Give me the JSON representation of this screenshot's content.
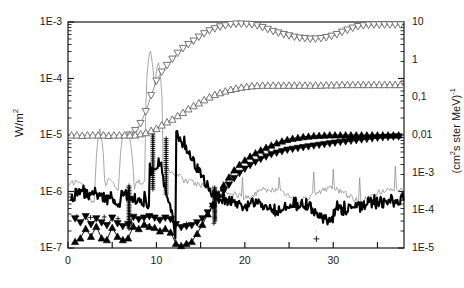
{
  "chart_data": {
    "type": "line",
    "title": "",
    "xlabel": "",
    "ylabel": "W/m²",
    "ylabel_right": "(cm²s ster MeV)⁻¹",
    "xlim": [
      0,
      38
    ],
    "ylim": [
      1e-07,
      0.001
    ],
    "yscale": "log",
    "xscale": "linear",
    "grid": false,
    "legend": "none",
    "xticks": [
      0,
      10,
      20,
      30
    ],
    "xticklabels": [
      "0",
      "10",
      "20",
      "30"
    ],
    "xminorticks": [
      5,
      15,
      25,
      35
    ],
    "yticks_left": [
      0.001,
      0.0001,
      1e-05,
      1e-06,
      1e-07
    ],
    "yticklabels_left": [
      "1E-3",
      "1E-4",
      "1E-5",
      "1E-6",
      "1E-7"
    ],
    "yticks_right": [
      10,
      1,
      0.1,
      0.01,
      0.001,
      0.0001,
      1e-05
    ],
    "yticklabels_right": [
      "10",
      "1",
      "0,1",
      "0,01",
      "1E-3",
      "1E-4",
      "1E-5"
    ],
    "colors": {
      "marker_open": "#666666",
      "marker_filled": "#000000",
      "thin_line": "#8c8c8c",
      "thick_line": "#000000",
      "axis": "#1a1a1a"
    },
    "series": [
      {
        "name": "open-down-triangle",
        "marker": "open-down-triangle",
        "x": [
          7.0,
          7.6,
          8.2,
          8.8,
          9.4,
          10.0,
          10.6,
          11.2,
          11.8,
          12.4,
          13.0,
          13.6,
          14.2,
          14.8,
          15.4,
          16.0,
          16.6,
          17.2,
          17.8,
          18.4,
          19.0,
          19.6,
          20.2,
          20.8,
          21.4,
          22.0,
          22.6,
          23.2,
          23.8,
          24.4,
          25.0,
          25.6,
          26.2,
          26.8,
          27.4,
          28.0,
          28.6,
          29.2,
          29.8,
          30.4,
          31.0,
          31.6,
          32.2,
          32.8,
          33.4,
          34.0,
          34.6,
          35.2,
          35.8,
          36.4,
          37.0,
          37.6
        ],
        "y": [
          1e-05,
          1.2e-05,
          1.6e-05,
          2.6e-05,
          5e-05,
          9e-05,
          0.00013,
          0.00017,
          0.00022,
          0.00028,
          0.00034,
          0.0004,
          0.00046,
          0.00054,
          0.00062,
          0.0007,
          0.00076,
          0.00082,
          0.00086,
          0.0009,
          0.00092,
          0.00092,
          0.00091,
          0.0009,
          0.00086,
          0.0008,
          0.00074,
          0.00068,
          0.00064,
          0.0006,
          0.00057,
          0.00054,
          0.00052,
          0.00051,
          0.0005,
          0.0005,
          0.00051,
          0.00053,
          0.00056,
          0.0006,
          0.00066,
          0.00072,
          0.00078,
          0.00083,
          0.00086,
          0.00088,
          0.00089,
          0.00089,
          0.00089,
          0.00089,
          0.00089,
          0.00089
        ]
      },
      {
        "name": "open-up-triangle",
        "marker": "open-up-triangle",
        "x": [
          0.4,
          1.0,
          1.6,
          2.2,
          2.8,
          3.4,
          4.0,
          4.6,
          5.2,
          5.8,
          6.4,
          7.0,
          7.6,
          8.2,
          8.8,
          9.4,
          10.0,
          10.6,
          11.2,
          11.8,
          12.4,
          13.0,
          13.6,
          14.2,
          14.8,
          15.4,
          16.0,
          16.6,
          17.2,
          17.8,
          18.4,
          19.0,
          19.6,
          20.2,
          20.8,
          21.4,
          22.0,
          22.6,
          23.2,
          23.8,
          24.4,
          25.0,
          25.6,
          26.2,
          26.8,
          27.4,
          28.0,
          28.6,
          29.2,
          29.8,
          30.4,
          31.0,
          31.6,
          32.2,
          32.8,
          33.4,
          34.0,
          34.6,
          35.2,
          35.8,
          36.4,
          37.0,
          37.6
        ],
        "y": [
          1e-05,
          1e-05,
          9.8e-06,
          1e-05,
          1e-05,
          1e-05,
          1e-05,
          9.8e-06,
          1e-05,
          1e-05,
          1e-05,
          1e-05,
          1e-05,
          1.05e-05,
          1.1e-05,
          1.2e-05,
          1.3e-05,
          1.5e-05,
          1.7e-05,
          1.9e-05,
          2.2e-05,
          2.5e-05,
          2.9e-05,
          3.3e-05,
          3.7e-05,
          4.2e-05,
          4.7e-05,
          5.2e-05,
          5.6e-05,
          6e-05,
          6.4e-05,
          6.7e-05,
          7e-05,
          7.2e-05,
          7.4e-05,
          7.5e-05,
          7.6e-05,
          7.6e-05,
          7.6e-05,
          7.6e-05,
          7.6e-05,
          7.6e-05,
          7.6e-05,
          7.6e-05,
          7.6e-05,
          7.6e-05,
          7.6e-05,
          7.6e-05,
          7.7e-05,
          7.7e-05,
          7.7e-05,
          7.8e-05,
          7.8e-05,
          7.8e-05,
          7.8e-05,
          7.8e-05,
          7.8e-05,
          7.8e-05,
          7.8e-05,
          7.8e-05,
          7.8e-05,
          7.8e-05,
          7.8e-05
        ]
      },
      {
        "name": "filled-up-triangle",
        "marker": "filled-up-triangle",
        "x": [
          0.8,
          1.4,
          2.0,
          2.6,
          3.2,
          3.8,
          4.4,
          5.0,
          5.6,
          6.2,
          6.8,
          7.4,
          8.0,
          8.6,
          9.2,
          9.8,
          10.4,
          11.0,
          11.6,
          12.2,
          12.8,
          13.4,
          14.0,
          14.6,
          15.2,
          15.8,
          16.4,
          17.0,
          17.6,
          18.2,
          18.8,
          19.4,
          20.0,
          20.6,
          21.2,
          21.8,
          22.4,
          23.0,
          23.6,
          24.2,
          24.8,
          25.4,
          26.0,
          26.6,
          27.2,
          27.8,
          28.4,
          29.0,
          29.6,
          30.2,
          30.8,
          31.4,
          32.0,
          32.6,
          33.2,
          33.8,
          34.4,
          35.0,
          35.6,
          36.2,
          36.8,
          37.4
        ],
        "y": [
          1.3e-07,
          1.5e-07,
          2.2e-07,
          1.6e-07,
          2.4e-07,
          1.5e-07,
          1.4e-07,
          2.3e-07,
          1.6e-07,
          1.4e-07,
          1.5e-07,
          2.4e-07,
          2.2e-07,
          2.6e-07,
          2.4e-07,
          2.3e-07,
          2e-07,
          2.2e-07,
          1.9e-07,
          1.2e-07,
          1.1e-07,
          1.2e-07,
          1.3e-07,
          1.8e-07,
          2.6e-07,
          4e-07,
          6e-07,
          9e-07,
          1.3e-06,
          1.8e-06,
          2.4e-06,
          3e-06,
          3.6e-06,
          4.2e-06,
          4.8e-06,
          5.4e-06,
          6e-06,
          6.6e-06,
          7.2e-06,
          7.8e-06,
          8.3e-06,
          8.7e-06,
          9e-06,
          9.3e-06,
          9.5e-06,
          9.7e-06,
          9.8e-06,
          9.9e-06,
          1e-05,
          1e-05,
          1e-05,
          1e-05,
          1e-05,
          1e-05,
          1e-05,
          1e-05,
          1e-05,
          1e-05,
          1e-05,
          1e-05,
          1e-05,
          1e-05
        ]
      },
      {
        "name": "filled-down-triangle",
        "marker": "filled-down-triangle",
        "x": [
          0.8,
          1.4,
          2.0,
          2.6,
          3.2,
          3.8,
          4.4,
          5.0,
          5.6,
          6.2,
          6.8,
          7.4,
          8.0,
          8.6,
          9.2,
          9.8,
          10.4,
          11.0,
          11.6,
          12.2,
          12.8,
          13.4,
          14.0,
          14.6,
          15.2,
          15.8,
          16.4,
          17.0,
          17.6,
          18.2,
          18.8,
          19.4,
          20.0,
          20.6,
          21.2,
          21.8,
          22.4,
          23.0,
          23.6,
          24.2,
          24.8,
          25.4,
          26.0,
          26.6,
          27.2,
          27.8,
          28.4,
          29.0,
          29.6,
          30.2,
          30.8,
          31.4,
          32.0,
          32.6,
          33.2,
          33.8,
          34.4,
          35.0,
          35.6,
          36.2,
          36.8,
          37.4
        ],
        "y": [
          3.3e-07,
          2.8e-07,
          3.6e-07,
          2.6e-07,
          3.3e-07,
          2.8e-07,
          2.5e-07,
          3.4e-07,
          2.7e-07,
          2.4e-07,
          2.6e-07,
          3.5e-07,
          3.2e-07,
          3.4e-07,
          3.6e-07,
          3.4e-07,
          3.1e-07,
          3.4e-07,
          3.2e-07,
          2.6e-07,
          2.3e-07,
          2.4e-07,
          2.5e-07,
          2.8e-07,
          3.3e-07,
          4.2e-07,
          5.5e-07,
          7.5e-07,
          1e-06,
          1.3e-06,
          1.7e-06,
          2.1e-06,
          2.5e-06,
          2.9e-06,
          3.3e-06,
          3.7e-06,
          4.1e-06,
          4.5e-06,
          4.8e-06,
          5.1e-06,
          5.4e-06,
          5.6e-06,
          5.8e-06,
          6e-06,
          6.2e-06,
          6.4e-06,
          6.6e-06,
          6.8e-06,
          7e-06,
          7.2e-06,
          7.4e-06,
          7.6e-06,
          7.8e-06,
          8e-06,
          8.2e-06,
          8.4e-06,
          8.6e-06,
          8.8e-06,
          9e-06,
          9.1e-06,
          9.2e-06,
          9.3e-06
        ]
      },
      {
        "name": "thin-spiky-line",
        "marker": "none",
        "note": "thin grey line with narrow tall spikes"
      },
      {
        "name": "thick-noisy-line",
        "marker": "none",
        "note": "thick black noisy trace near 1E-6"
      },
      {
        "name": "plus-markers",
        "marker": "plus",
        "note": "dense vertical plus-marker stems and one isolated point near x=28"
      }
    ]
  }
}
